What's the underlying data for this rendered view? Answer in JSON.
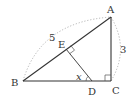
{
  "figure": {
    "type": "geometry-triangle",
    "points": {
      "A": {
        "label": "A"
      },
      "B": {
        "label": "B"
      },
      "C": {
        "label": "C"
      },
      "D": {
        "label": "D"
      },
      "E": {
        "label": "E"
      }
    },
    "lengths": {
      "AB": "5",
      "AC": "3"
    },
    "angle_label": "x",
    "colors": {
      "line": "#333333",
      "dotted": "#aaaaaa",
      "text": "#333333"
    }
  }
}
